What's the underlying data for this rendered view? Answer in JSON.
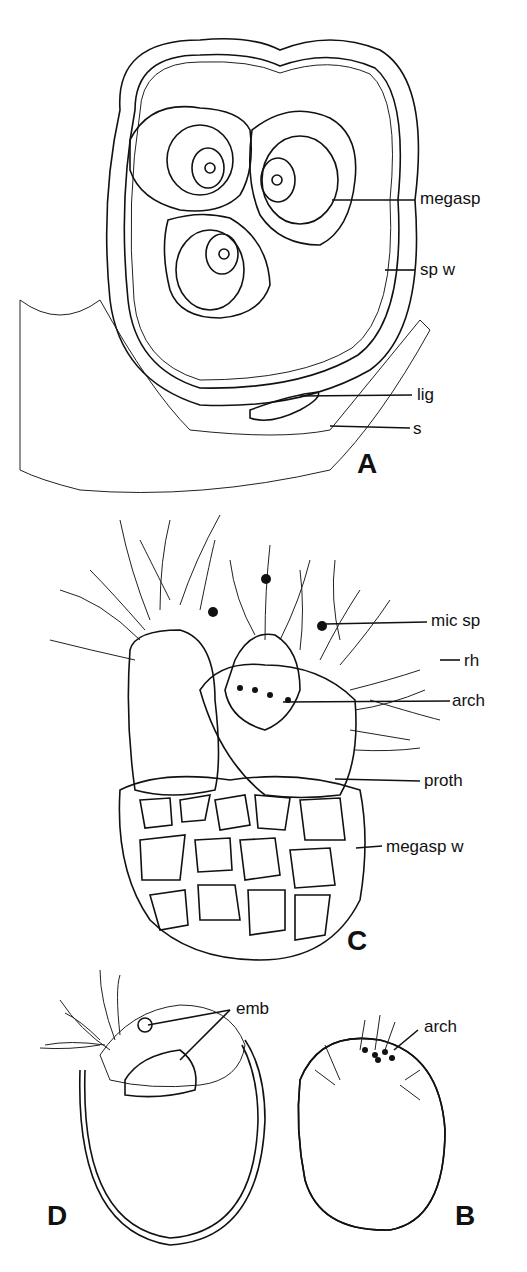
{
  "figure": {
    "panels": [
      {
        "id": "A",
        "label": "A",
        "annotations": [
          "megasp",
          "sp w",
          "lig",
          "s"
        ]
      },
      {
        "id": "C",
        "label": "C",
        "annotations": [
          "mic sp",
          "rh",
          "arch",
          "proth",
          "megasp w"
        ]
      },
      {
        "id": "D",
        "label": "D",
        "annotations": [
          "emb"
        ]
      },
      {
        "id": "B",
        "label": "B",
        "annotations": [
          "arch"
        ]
      }
    ]
  },
  "labels": {
    "A": {
      "megasp": "megasp",
      "sp_w": "sp w",
      "lig": "lig",
      "s": "s"
    },
    "C": {
      "mic_sp": "mic sp",
      "rh": "rh",
      "arch": "arch",
      "proth": "proth",
      "megasp_w": "megasp w"
    },
    "D": {
      "emb": "emb"
    },
    "B": {
      "arch": "arch"
    }
  },
  "colors": {
    "ink": "#111111",
    "background": "#ffffff"
  }
}
